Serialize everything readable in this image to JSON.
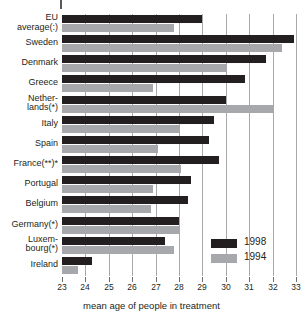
{
  "chart_data": {
    "type": "bar",
    "orientation": "horizontal",
    "title": "",
    "xlabel": "mean age of people in treatment",
    "ylabel": "",
    "xlim": [
      23,
      33
    ],
    "xticks": [
      "23",
      "24",
      "25",
      "26",
      "27",
      "28",
      "29",
      "30",
      "31",
      "32",
      "33"
    ],
    "grid": true,
    "legend_position": "bottom-right",
    "categories": [
      "EU\naverage(:)",
      "Sweden",
      "Denmark",
      "Greece",
      "Nether-\nlands(*)",
      "Italy",
      "Spain",
      "France(**)*",
      "Portugal",
      "Belgium",
      "Germany(*)",
      "Luxem-\nbourg(*)",
      "Ireland"
    ],
    "series": [
      {
        "name": "1998",
        "color": "#231f20",
        "values": [
          29.0,
          32.9,
          31.7,
          30.8,
          30.0,
          29.5,
          29.3,
          29.7,
          28.5,
          28.4,
          28.0,
          27.4,
          24.3
        ]
      },
      {
        "name": "1994",
        "color": "#a6a8ab",
        "values": [
          27.8,
          32.4,
          30.0,
          26.9,
          32.0,
          28.0,
          27.1,
          28.1,
          26.9,
          26.8,
          28.0,
          27.8,
          23.7
        ]
      }
    ]
  },
  "legend": {
    "items": [
      {
        "label": "1998",
        "color": "#231f20"
      },
      {
        "label": "1994",
        "color": "#a6a8ab"
      }
    ]
  },
  "axis": {
    "title": "mean age of people in treatment"
  }
}
